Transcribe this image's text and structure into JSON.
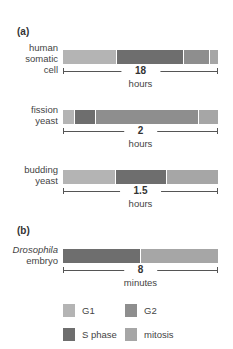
{
  "colors": {
    "G1": "#b4b4b4",
    "S": "#6e6e6e",
    "G2": "#8e8e8e",
    "M": "#a6a6a6"
  },
  "panels": {
    "a": {
      "label": "(a)"
    },
    "b": {
      "label": "(b)"
    }
  },
  "organisms": [
    {
      "name_lines": [
        "human",
        "somatic",
        "cell"
      ],
      "total": "18",
      "unit": "hours",
      "segments": [
        {
          "phase": "G1",
          "frac": 0.35
        },
        {
          "phase": "S",
          "frac": 0.43
        },
        {
          "phase": "G2",
          "frac": 0.17
        },
        {
          "phase": "M",
          "frac": 0.05
        }
      ]
    },
    {
      "name_lines": [
        "fission",
        "yeast"
      ],
      "total": "2",
      "unit": "hours",
      "segments": [
        {
          "phase": "G1",
          "frac": 0.08
        },
        {
          "phase": "S",
          "frac": 0.13
        },
        {
          "phase": "G2",
          "frac": 0.67
        },
        {
          "phase": "M",
          "frac": 0.12
        }
      ]
    },
    {
      "name_lines": [
        "budding",
        "yeast"
      ],
      "total": "1.5",
      "unit": "hours",
      "segments": [
        {
          "phase": "G1",
          "frac": 0.34
        },
        {
          "phase": "S",
          "frac": 0.33
        },
        {
          "phase": "M",
          "frac": 0.33
        }
      ]
    },
    {
      "name_lines": [
        "Drosophila",
        "embryo"
      ],
      "italic_first": true,
      "total": "8",
      "unit": "minutes",
      "segments": [
        {
          "phase": "S",
          "frac": 0.5
        },
        {
          "phase": "M",
          "frac": 0.5
        }
      ]
    }
  ],
  "legend": [
    {
      "key": "G1",
      "label": "G1"
    },
    {
      "key": "G2",
      "label": "G2"
    },
    {
      "key": "S",
      "label": "S phase"
    },
    {
      "key": "M",
      "label": "mitosis"
    }
  ]
}
